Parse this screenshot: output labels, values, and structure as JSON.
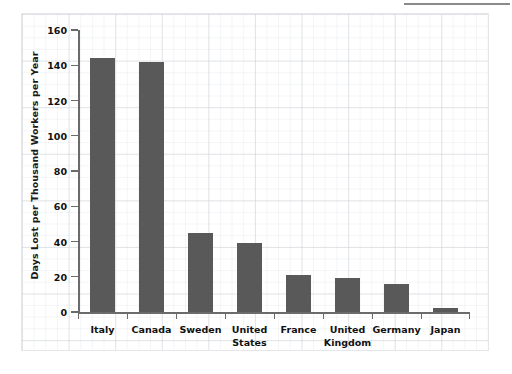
{
  "chart_data": {
    "type": "bar",
    "title": "",
    "subtitle": "",
    "xlabel": "",
    "ylabel": "Days Lost per Thousand Workers per Year",
    "categories": [
      "Italy",
      "Canada",
      "Sweden",
      "United States",
      "France",
      "United Kingdom",
      "Germany",
      "Japan"
    ],
    "values": [
      144,
      142,
      45,
      39,
      21,
      19.5,
      16,
      2
    ],
    "ylim": [
      0,
      160
    ],
    "ytick_labels": [
      "0",
      "20",
      "40",
      "60",
      "80",
      "100",
      "120",
      "140",
      "160"
    ],
    "ytick_values": [
      0,
      20,
      40,
      60,
      80,
      100,
      120,
      140,
      160
    ],
    "ytick_step": 20,
    "grid": "background graph-paper only",
    "legend": "none",
    "bar_color": "#595959",
    "axis_color": "#6b6b6b",
    "text_color": "#111111",
    "background_color": "#ffffff"
  },
  "decor": {
    "top_rule_color": "#8a8a8a"
  }
}
